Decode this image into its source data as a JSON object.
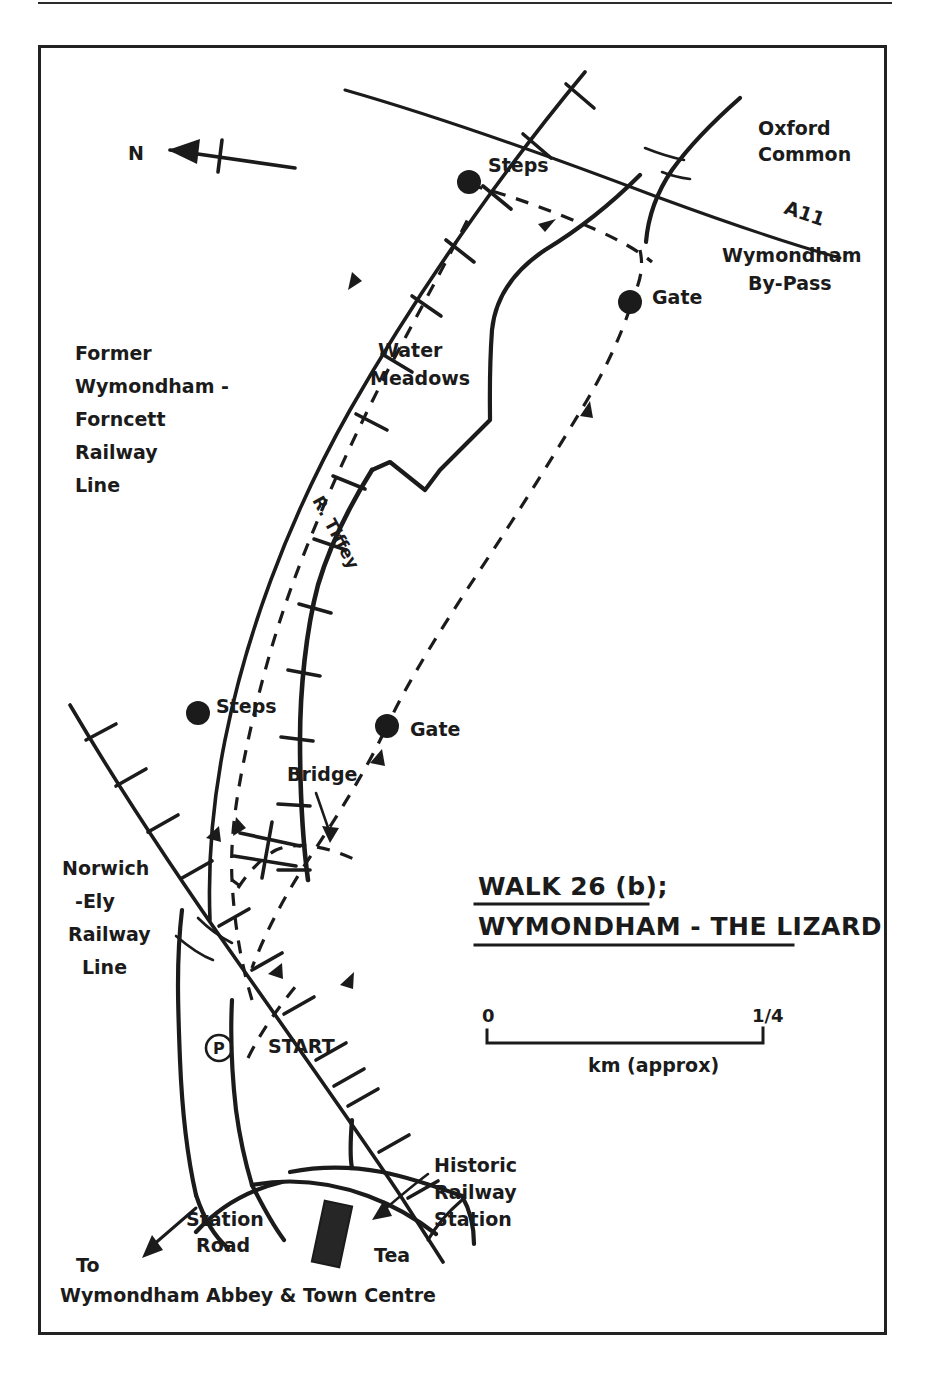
{
  "document": {
    "type": "hand-drawn walking route map",
    "title_line1": "WALK 26 (b);",
    "title_line2": "WYMONDHAM - THE LIZARD"
  },
  "compass": {
    "label": "N",
    "direction": "left"
  },
  "scale": {
    "start_label": "0",
    "end_label": "1/4",
    "end_label_numerator": "1",
    "end_label_denominator": "4",
    "units_label": "km (approx)"
  },
  "labels": {
    "former_railway": [
      "Former",
      "Wymondham -",
      "Forncett",
      "Railway",
      "Line"
    ],
    "norwich_ely_railway": [
      "Norwich",
      "-Ely",
      "Railway",
      "Line"
    ],
    "oxford_common": [
      "Oxford",
      "Common"
    ],
    "a11": "A11",
    "bypass": [
      "Wymondham",
      "By-Pass"
    ],
    "water_meadows": [
      "Water",
      "Meadows"
    ],
    "river": "R. Tiffey",
    "steps_north": "Steps",
    "steps_south": "Steps",
    "gate_north": "Gate",
    "gate_south": "Gate",
    "bridge": "Bridge",
    "start": "START",
    "parking_symbol": "P",
    "station_road": [
      "Station",
      "Road"
    ],
    "tea": "Tea",
    "historic_station": [
      "Historic",
      "Railway",
      "Station"
    ],
    "to_town": [
      "To",
      "Wymondham Abbey & Town Centre"
    ]
  },
  "colors": {
    "ink": "#1b1b1b",
    "paper": "#ffffff",
    "frame": "#222222"
  }
}
